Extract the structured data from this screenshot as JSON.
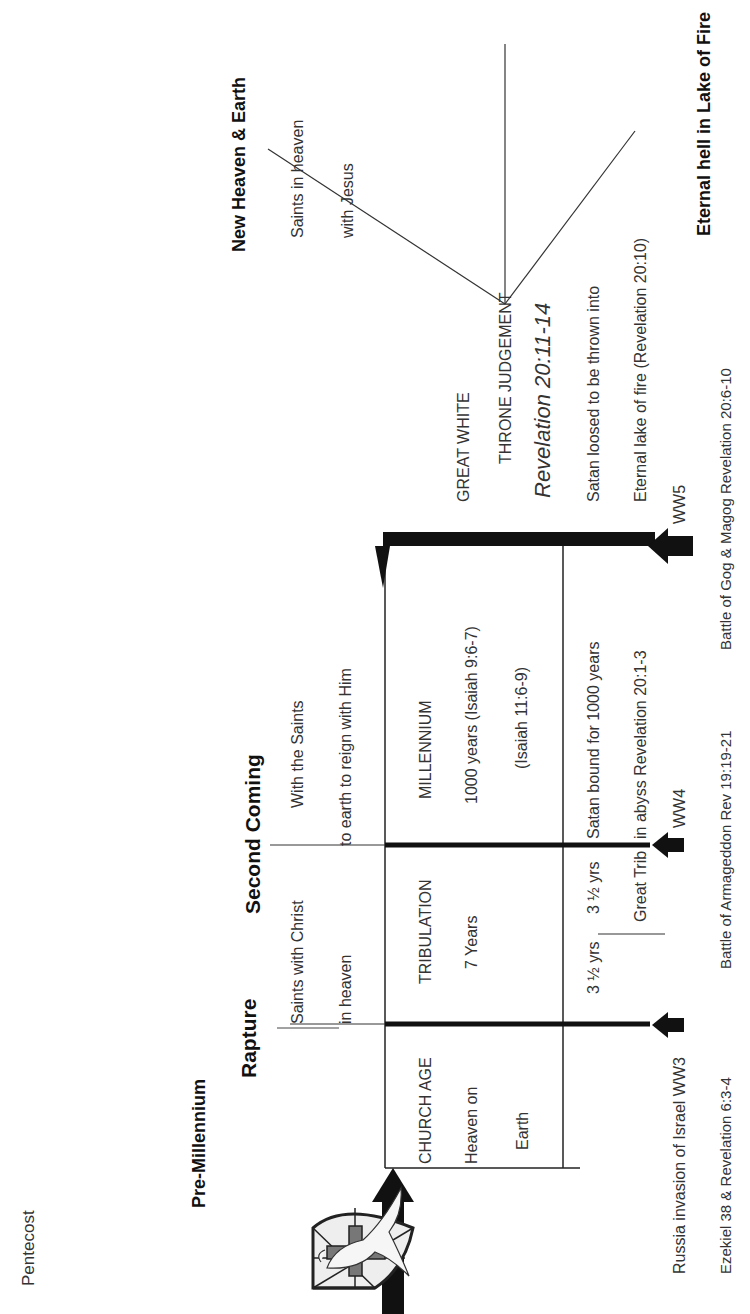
{
  "diagram": {
    "top_label": "Pentecost",
    "header": {
      "title": "Pre-Millennium",
      "rapture": "Rapture",
      "second_coming": "Second Coming",
      "new_heaven": "New Heaven & Earth",
      "eternal_hell": "Eternal hell in Lake of Fire"
    },
    "rapture_notes": [
      "Saints with Christ",
      "in heaven"
    ],
    "second_coming_notes": [
      "With the Saints",
      "to earth to reign with Him"
    ],
    "new_heaven_notes": [
      "Saints in heaven",
      "with Jesus"
    ],
    "periods": {
      "church_age": [
        "CHURCH AGE",
        "Heaven on",
        "Earth"
      ],
      "tribulation": [
        "TRIBULATION",
        "7 Years"
      ],
      "millennium": [
        "MILLENNIUM",
        "1000 years (Isaiah 9:6-7)",
        "(Isaiah 11:6-9)"
      ]
    },
    "lower_row": {
      "first_half": "3 ½ yrs",
      "second_half": "3 ½ yrs",
      "great_trib": "Great Trib",
      "satan_bound": [
        "Satan bound for 1000 years",
        "in abyss Revelation 20:1-3"
      ]
    },
    "judgement": {
      "line1": "GREAT WHITE",
      "line2": "THRONE JUDGEMENT",
      "reference": "Revelation 20:11-14",
      "notes": [
        "Satan loosed to be thrown into",
        "Eternal lake of fire (Revelation 20:10)"
      ]
    },
    "wars": {
      "ww3": "Russia invasion of Israel WW3",
      "ww4": "WW4",
      "ww5": "WW5"
    },
    "references": {
      "ww3": "Ezekiel 38 & Revelation 6:3-4",
      "ww4": "Battle of Armageddon Rev 19:19-21",
      "ww5": "Battle of Gog & Magog Revelation 20:6-10"
    },
    "icons": {
      "church_logo": "shield-cross-dove-icon",
      "arrow": "arrow-right-icon",
      "war_arrow": "arrow-up-icon"
    },
    "colors": {
      "line": "#111111",
      "text": "#333333",
      "cross": "#777777"
    }
  }
}
